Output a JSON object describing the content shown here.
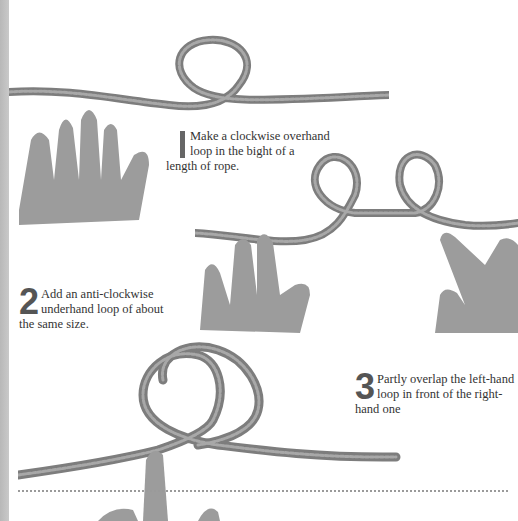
{
  "page": {
    "type": "knot-tying instructions",
    "accent_strip_color": "#c0c0c0",
    "divider_style": "dotted"
  },
  "steps": [
    {
      "number": "1",
      "text": "Make a clockwise overhand loop in the bight of a length of rope.",
      "image": "hand holding rope with single clockwise overhand loop"
    },
    {
      "number": "2",
      "text": "Add an anti-clockwise underhand loop of about the same size.",
      "image": "two hands holding rope with two adjacent loops"
    },
    {
      "number": "3",
      "text": "Partly overlap the left-hand loop in front of the right-hand one",
      "image": "finger holding two overlapping rope loops"
    }
  ],
  "captions": {
    "step1_line1": "Make a clockwise overhand",
    "step1_line2": "loop in the bight of a",
    "step1_line3": "length of rope.",
    "step2_line1": "Add an anti-clockwise",
    "step2_line2": "underhand loop of about",
    "step2_line3": "the same size.",
    "step3_line1": "Partly overlap the left-hand",
    "step3_line2": "loop in front of the right-",
    "step3_line3": "hand one",
    "num2": "2",
    "num3": "3"
  }
}
